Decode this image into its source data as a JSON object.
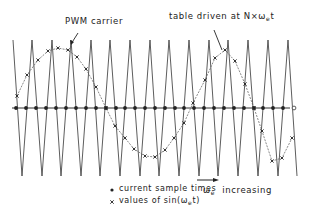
{
  "labels": {
    "carrier": "PWM carrier",
    "table_prefix": "table driven at N×ω",
    "table_sub": "e",
    "table_suffix": "t",
    "increasing_symbol": "ω",
    "increasing_sub": "e",
    "increasing_text": "increasing",
    "legend_dot": "current sample times",
    "legend_cross_prefix": "values of  sin(ω",
    "legend_cross_sub": "e",
    "legend_cross_suffix": "t)"
  },
  "legend": [
    {
      "marker": "dot",
      "text": "current sample times"
    },
    {
      "marker": "cross",
      "text": "values of sin(ωe t)"
    }
  ],
  "colors": {
    "ink": "#222222",
    "background": "#ffffff"
  },
  "geometry": {
    "axis_y": 108,
    "axis_x_start": 12,
    "axis_x_end": 290,
    "carrier_top_y": 40,
    "carrier_bottom_y": 176,
    "carrier_peaks_x": [
      13,
      32,
      52,
      71,
      91,
      110,
      130,
      150,
      169,
      189,
      209,
      228,
      248,
      268,
      288
    ],
    "carrier_troughs_x": [
      22,
      42,
      61,
      81,
      100,
      120,
      140,
      159,
      179,
      199,
      218,
      238,
      258,
      278,
      297
    ],
    "sample_dots_x": [
      16,
      26,
      36,
      46,
      56,
      66,
      76,
      86,
      96,
      106,
      116,
      125,
      135,
      145,
      155,
      165,
      175,
      184,
      194,
      204,
      214,
      224,
      234,
      244,
      254,
      263,
      273,
      283
    ],
    "sample_open_x": 294,
    "sine_crosses": [
      [
        17,
        96
      ],
      [
        27,
        75
      ],
      [
        38,
        60
      ],
      [
        48,
        51
      ],
      [
        58,
        48
      ],
      [
        68,
        50
      ],
      [
        77,
        57
      ],
      [
        86,
        69
      ],
      [
        96,
        87
      ],
      [
        106,
        108
      ],
      [
        115,
        126
      ],
      [
        125,
        138
      ],
      [
        134,
        149
      ],
      [
        145,
        156
      ],
      [
        155,
        157
      ],
      [
        165,
        150
      ],
      [
        174,
        138
      ],
      [
        184,
        123
      ],
      [
        193,
        103
      ],
      [
        205,
        80
      ],
      [
        215,
        58
      ],
      [
        225,
        50
      ],
      [
        235,
        61
      ],
      [
        245,
        84
      ],
      [
        254,
        108
      ],
      [
        262,
        131
      ],
      [
        272,
        161
      ],
      [
        282,
        158
      ],
      [
        292,
        138
      ]
    ]
  }
}
